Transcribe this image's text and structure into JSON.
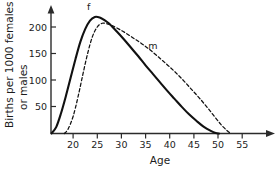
{
  "chart_data": {
    "type": "line",
    "title": "",
    "xlabel": "Age",
    "ylabel_line1": "Births per 1000 females",
    "ylabel_line2": "or males",
    "xlim": [
      13,
      58
    ],
    "ylim": [
      0,
      235
    ],
    "grid": false,
    "legend_position": "inline-annotations",
    "x_ticks": [
      20,
      25,
      30,
      35,
      40,
      45,
      50,
      55
    ],
    "x_tick_labels": [
      "20",
      "25",
      "30",
      "35",
      "40",
      "45",
      "50",
      "55"
    ],
    "y_ticks": [
      50,
      100,
      150,
      200
    ],
    "y_tick_labels": [
      "50",
      "100",
      "150",
      "200"
    ],
    "annotations": [
      {
        "text": "f",
        "x": 23.2,
        "y": 232,
        "series": "females"
      },
      {
        "text": "m",
        "x": 36.5,
        "y": 158,
        "series": "males"
      }
    ],
    "series": [
      {
        "name": "f",
        "full_name": "females",
        "style": "solid",
        "x": [
          15.5,
          16.5,
          17.5,
          18.5,
          19.5,
          20.5,
          21.5,
          22.5,
          23.5,
          24.5,
          25.5,
          26.5,
          27.5,
          29,
          30.5,
          32,
          33.5,
          35,
          36.5,
          38,
          39.5,
          41,
          42.5,
          44,
          45.5,
          47,
          48.5,
          49.5,
          50.2
        ],
        "y": [
          0,
          12,
          38,
          70,
          105,
          140,
          172,
          196,
          212,
          219,
          218,
          213,
          206,
          192,
          177,
          161,
          145,
          128,
          112,
          96,
          80,
          65,
          50,
          36,
          24,
          13,
          5,
          1,
          0
        ]
      },
      {
        "name": "m",
        "full_name": "males",
        "style": "dashed",
        "x": [
          18.2,
          19,
          20,
          21,
          22,
          23,
          24,
          25,
          26,
          27,
          28,
          29.5,
          31,
          32.5,
          34,
          35.5,
          37,
          38.5,
          40,
          41.5,
          43,
          44.5,
          46,
          47.5,
          49,
          50.5,
          51.8,
          52.6
        ],
        "y": [
          0,
          9,
          32,
          68,
          110,
          150,
          182,
          200,
          207,
          206,
          203,
          196,
          188,
          179,
          170,
          160,
          149,
          137,
          125,
          112,
          98,
          83,
          68,
          52,
          35,
          18,
          6,
          0
        ]
      }
    ]
  },
  "axes": {
    "y_arrow": "up-arrow",
    "x_arrow": "right-arrow"
  }
}
